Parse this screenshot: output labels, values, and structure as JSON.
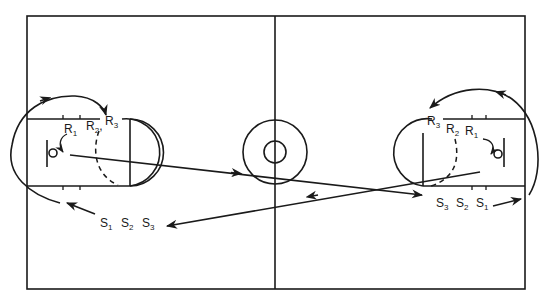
{
  "diagram": {
    "type": "basketball court play diagram",
    "court": {
      "line_color": "#1a1a1a",
      "background": "#ffffff"
    },
    "left_basket": {
      "rebound_labels": [
        {
          "main": "R",
          "sub": "1"
        },
        {
          "main": "R",
          "sub": "2"
        },
        {
          "main": "R",
          "sub": "3"
        }
      ],
      "shooter_labels": [
        {
          "main": "S",
          "sub": "1"
        },
        {
          "main": "S",
          "sub": "2"
        },
        {
          "main": "S",
          "sub": "3"
        }
      ]
    },
    "right_basket": {
      "rebound_labels": [
        {
          "main": "R",
          "sub": "3"
        },
        {
          "main": "R",
          "sub": "2"
        },
        {
          "main": "R",
          "sub": "1"
        }
      ],
      "shooter_labels": [
        {
          "main": "S",
          "sub": "3"
        },
        {
          "main": "S",
          "sub": "2"
        },
        {
          "main": "S",
          "sub": "1"
        }
      ]
    },
    "separator": ","
  }
}
